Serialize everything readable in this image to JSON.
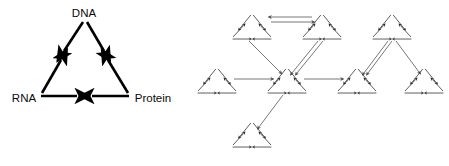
{
  "figure": {
    "title": "",
    "background_color": "#ffffff",
    "panels": [
      {
        "id": "panel-left",
        "name": "central-dogma-triangle",
        "stroke_color": "#000000",
        "stroke_width": 2.6,
        "nodes": [
          {
            "id": "dna",
            "label": "DNA",
            "x": 84,
            "y": 14,
            "label_anchor": "middle"
          },
          {
            "id": "rna",
            "label": "RNA",
            "x": 22,
            "y": 98,
            "label_anchor": "middle"
          },
          {
            "id": "protein",
            "label": "Protein",
            "x": 152,
            "y": 98,
            "label_anchor": "middle"
          }
        ],
        "edges": [
          {
            "id": "dna-to-rna",
            "from": "DNA",
            "to": "RNA",
            "direction": "down-left"
          },
          {
            "id": "dna-to-protein",
            "from": "DNA",
            "to": "Protein",
            "direction": "down-right"
          },
          {
            "id": "rna-to-dna",
            "from": "RNA",
            "to": "DNA",
            "direction": "up-right"
          },
          {
            "id": "protein-to-dna",
            "from": "Protein",
            "to": "DNA",
            "direction": "up-left"
          },
          {
            "id": "rna-to-center",
            "from": "RNA",
            "to": "center",
            "direction": "right"
          },
          {
            "id": "protein-to-center",
            "from": "Protein",
            "to": "center",
            "direction": "left"
          }
        ]
      },
      {
        "id": "panel-right",
        "name": "recursive-triangle-network",
        "stroke_color": "#4a4a4a",
        "stroke_width": 0.75,
        "unit_stroke_color": "#2a2a2a",
        "description": "network whose every node is itself a miniature copy of the central-dogma triangle",
        "units": [
          {
            "id": "u-top-left",
            "cx": 252,
            "cy": 26,
            "size": 42
          },
          {
            "id": "u-top-right",
            "cx": 322,
            "cy": 26,
            "size": 42
          },
          {
            "id": "u-left",
            "cx": 217,
            "cy": 80,
            "size": 42
          },
          {
            "id": "u-hub",
            "cx": 287,
            "cy": 80,
            "size": 42
          },
          {
            "id": "u-right-mid",
            "cx": 357,
            "cy": 80,
            "size": 42
          },
          {
            "id": "u-far-top",
            "cx": 392,
            "cy": 26,
            "size": 42
          },
          {
            "id": "u-far-right",
            "cx": 424,
            "cy": 80,
            "size": 42
          },
          {
            "id": "u-bottom",
            "cx": 252,
            "cy": 134,
            "size": 42
          }
        ],
        "links": [
          {
            "id": "l-topright-to-topleft",
            "from": "u-top-right",
            "to": "u-top-left",
            "style": "double",
            "direction": "left"
          },
          {
            "id": "l-topleft-to-topright",
            "from": "u-top-left",
            "to": "u-top-right",
            "style": "double",
            "direction": "right"
          },
          {
            "id": "l-topleft-to-hub",
            "from": "u-top-left",
            "to": "u-hub",
            "style": "single",
            "direction": "down-right"
          },
          {
            "id": "l-topright-to-hub",
            "from": "u-top-right",
            "to": "u-hub",
            "style": "double",
            "direction": "down-left"
          },
          {
            "id": "l-left-to-hub",
            "from": "u-left",
            "to": "u-hub",
            "style": "single",
            "direction": "right"
          },
          {
            "id": "l-hub-to-rightmid",
            "from": "u-hub",
            "to": "u-right-mid",
            "style": "single",
            "direction": "right"
          },
          {
            "id": "l-hub-to-bottom",
            "from": "u-hub",
            "to": "u-bottom",
            "style": "single",
            "direction": "down-left"
          },
          {
            "id": "l-fartop-to-rightmid",
            "from": "u-far-top",
            "to": "u-right-mid",
            "style": "double",
            "direction": "down-left"
          },
          {
            "id": "l-fartop-to-farright",
            "from": "u-far-top",
            "to": "u-far-right",
            "style": "single",
            "direction": "down-right"
          }
        ]
      }
    ]
  }
}
